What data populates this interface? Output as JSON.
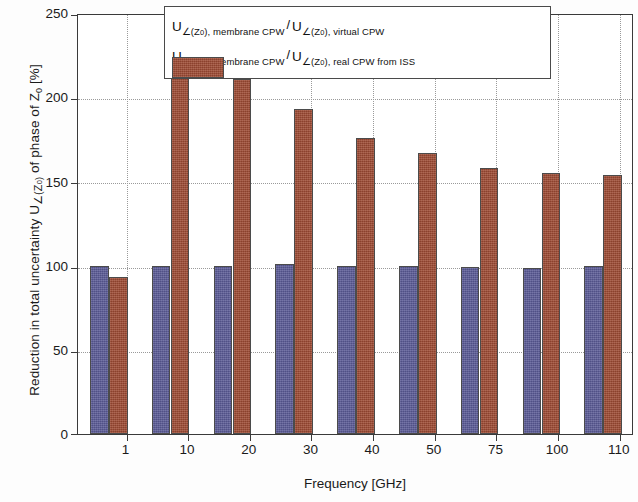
{
  "chart_data": {
    "type": "bar",
    "title": "",
    "xlabel": "Frequency [GHz]",
    "ylabel": "Reduction in total uncertainty U∠(Z0) of phase of Z0  [%]",
    "categories": [
      "1",
      "10",
      "20",
      "30",
      "40",
      "50",
      "75",
      "100",
      "110"
    ],
    "ylim": [
      0,
      250
    ],
    "yticks": [
      0,
      50,
      100,
      150,
      200,
      250
    ],
    "grid": true,
    "legend_position": "top-center",
    "series": [
      {
        "name": "U∠(Z0), membrane CPW / U∠(Z0), virtual CPW",
        "color": "#5a5a96",
        "values": [
          100,
          100,
          100,
          101,
          99.5,
          99.5,
          99,
          98.5,
          100
        ]
      },
      {
        "name": "U∠(Z0), membrane CPW / U∠(Z0), real CPW from ISS",
        "color": "#9e4a33",
        "values": [
          93,
          227,
          211,
          193,
          176,
          167,
          158,
          155,
          154
        ]
      }
    ]
  },
  "axes": {
    "y": {
      "label_prefix": "Reduction in total uncertainty U",
      "label_sub1": "∠(Z",
      "label_sub1_z": "0",
      "label_sub1_end": ")",
      "label_mid": " of phase of Z",
      "label_z2": "0",
      "label_units": "  [%]",
      "ticks": [
        "250",
        "200",
        "150",
        "100",
        "50",
        "0"
      ]
    },
    "x": {
      "label": "Frequency [GHz]",
      "ticks": [
        "1",
        "10",
        "20",
        "30",
        "40",
        "50",
        "75",
        "100",
        "110"
      ]
    }
  },
  "legend": {
    "entries": [
      {
        "swatch_color": "#5a5a96",
        "u1": "U",
        "sub1_pre": "∠(Z",
        "sub1_z": "0",
        "sub1_post": "), membrane CPW",
        "slash": "/",
        "u2": "U",
        "sub2_pre": "∠(Z",
        "sub2_z": "0",
        "sub2_post": "), virtual CPW"
      },
      {
        "swatch_color": "#9e4a33",
        "u1": "U",
        "sub1_pre": "∠(Z",
        "sub1_z": "0",
        "sub1_post": "), membrane CPW",
        "slash": "/",
        "u2": "U",
        "sub2_pre": "∠(Z",
        "sub2_z": "0",
        "sub2_post": "), real CPW from ISS"
      }
    ]
  }
}
